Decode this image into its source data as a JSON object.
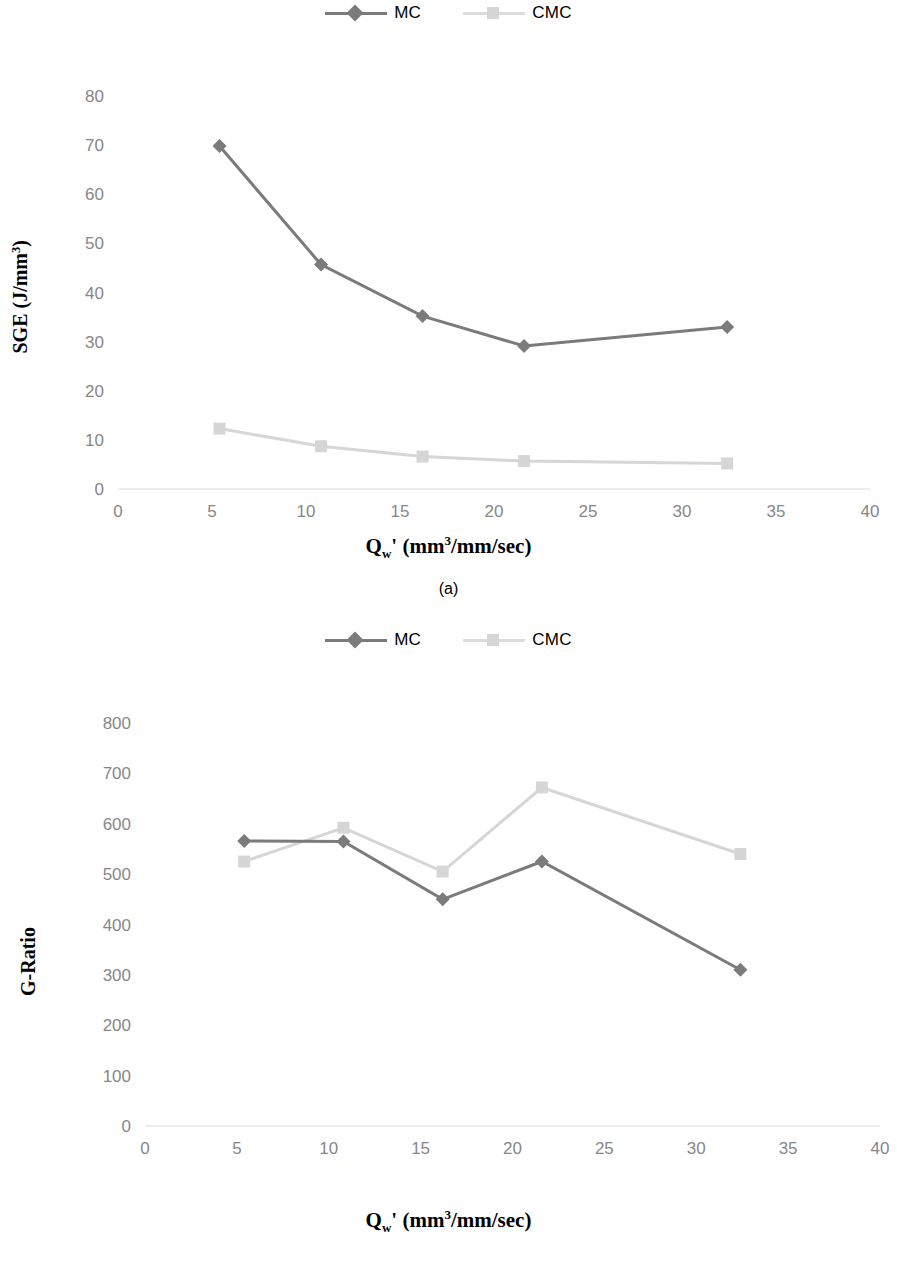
{
  "figure": {
    "panels": [
      {
        "id": "a",
        "caption": "(a)",
        "legend": [
          {
            "label": "MC",
            "marker": "diamond",
            "color": "#7b7b7b"
          },
          {
            "label": "CMC",
            "marker": "square",
            "color": "#d6d6d6"
          }
        ],
        "chart_data": {
          "type": "line",
          "title": "",
          "xlabel": "Qw' (mm3/mm/sec)",
          "ylabel": "SGE (J/mm3)",
          "xlim": [
            0,
            40
          ],
          "ylim": [
            0,
            80
          ],
          "xticks": [
            0,
            5,
            10,
            15,
            20,
            25,
            30,
            35,
            40
          ],
          "yticks": [
            0,
            10,
            20,
            30,
            40,
            50,
            60,
            70,
            80
          ],
          "grid": false,
          "legend_position": "top-center",
          "x": [
            5.4,
            10.8,
            16.2,
            21.6,
            32.4
          ],
          "series": [
            {
              "name": "MC",
              "color": "#7b7b7b",
              "marker": "diamond",
              "values": [
                69.8,
                45.7,
                35.2,
                29.1,
                33.0
              ]
            },
            {
              "name": "CMC",
              "color": "#d6d6d6",
              "marker": "square",
              "values": [
                12.3,
                8.7,
                6.6,
                5.7,
                5.2
              ]
            }
          ]
        }
      },
      {
        "id": "b",
        "caption": "(b)",
        "legend": [
          {
            "label": "MC",
            "marker": "diamond",
            "color": "#7b7b7b"
          },
          {
            "label": "CMC",
            "marker": "square",
            "color": "#d6d6d6"
          }
        ],
        "chart_data": {
          "type": "line",
          "title": "",
          "xlabel": "Qw' (mm3/mm/sec)",
          "ylabel": "G-Ratio",
          "xlim": [
            0,
            40
          ],
          "ylim": [
            0,
            800
          ],
          "xticks": [
            0,
            5,
            10,
            15,
            20,
            25,
            30,
            35,
            40
          ],
          "yticks": [
            0,
            100,
            200,
            300,
            400,
            500,
            600,
            700,
            800
          ],
          "grid": false,
          "legend_position": "top-center",
          "x": [
            5.4,
            10.8,
            16.2,
            21.6,
            32.4
          ],
          "series": [
            {
              "name": "MC",
              "color": "#7b7b7b",
              "marker": "diamond",
              "values": [
                566,
                565,
                450,
                525,
                310
              ]
            },
            {
              "name": "CMC",
              "color": "#d6d6d6",
              "marker": "square",
              "values": [
                525,
                592,
                505,
                672,
                540
              ]
            }
          ]
        }
      }
    ],
    "axis_label_x_html": "Q<sub>w</sub>' (mm<sup>3</sup>/mm/sec)",
    "axis_label_y_a_html": "SGE (J/mm<sup>3</sup>)",
    "axis_label_y_b_text": "G-Ratio"
  }
}
